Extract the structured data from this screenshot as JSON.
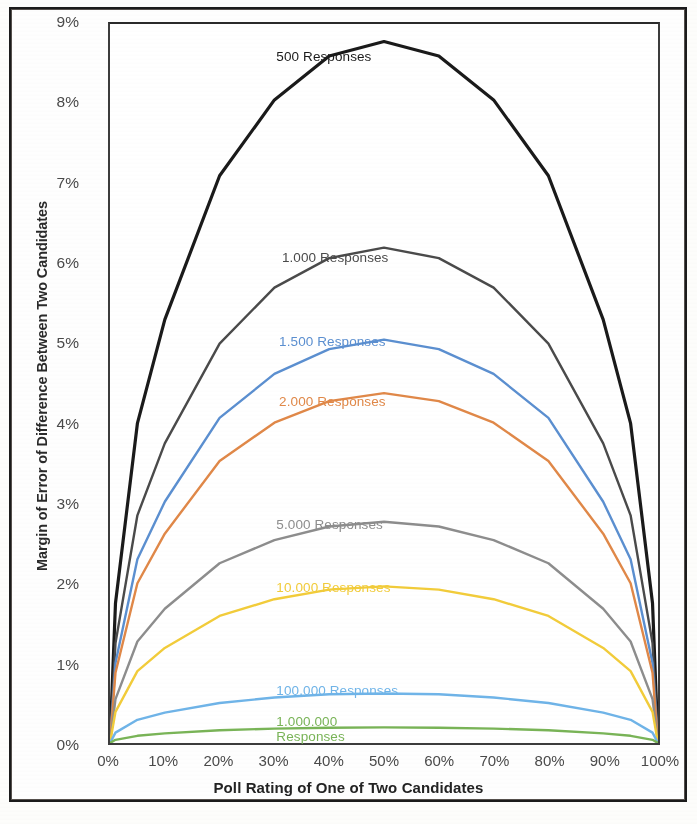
{
  "chart_data": {
    "type": "line",
    "title": "",
    "xlabel": "Poll Rating of One of Two Candidates",
    "ylabel": "Margin of Error of Difference Between Two Candidates",
    "xlim": [
      0,
      100
    ],
    "ylim": [
      0,
      9
    ],
    "grid": false,
    "legend_position": "inline-labels",
    "x_tick_labels": [
      "0%",
      "10%",
      "20%",
      "30%",
      "40%",
      "50%",
      "60%",
      "70%",
      "80%",
      "90%",
      "100%"
    ],
    "x_tick_values": [
      0,
      10,
      20,
      30,
      40,
      50,
      60,
      70,
      80,
      90,
      100
    ],
    "y_tick_labels": [
      "0%",
      "1%",
      "2%",
      "3%",
      "4%",
      "5%",
      "6%",
      "7%",
      "8%",
      "9%"
    ],
    "y_tick_values": [
      0,
      1,
      2,
      3,
      4,
      5,
      6,
      7,
      8,
      9
    ],
    "x": [
      0,
      1,
      5,
      10,
      20,
      30,
      40,
      50,
      60,
      70,
      80,
      90,
      95,
      99,
      100
    ],
    "series": [
      {
        "name": "500 Responses",
        "color": "#1a1a1a",
        "label_x_pct": 30.5,
        "label_y_pct": 96.2,
        "values": [
          0.0,
          1.75,
          4.0,
          5.3,
          7.1,
          8.05,
          8.6,
          8.78,
          8.6,
          8.05,
          7.1,
          5.3,
          4.0,
          1.75,
          0.0
        ]
      },
      {
        "name": "1.000 Responses",
        "color": "#4a4a4a",
        "label_x_pct": 31.5,
        "label_y_pct": 68.5,
        "values": [
          0.0,
          1.25,
          2.85,
          3.75,
          5.0,
          5.7,
          6.07,
          6.2,
          6.07,
          5.7,
          5.0,
          3.75,
          2.85,
          1.25,
          0.0
        ]
      },
      {
        "name": "1.500 Responses",
        "color": "#5b8fd0",
        "label_x_pct": 31.0,
        "label_y_pct": 56.8,
        "values": [
          0.0,
          1.0,
          2.3,
          3.02,
          4.07,
          4.62,
          4.93,
          5.05,
          4.93,
          4.62,
          4.07,
          3.02,
          2.3,
          1.0,
          0.0
        ]
      },
      {
        "name": "2.000 Responses",
        "color": "#e08848",
        "label_x_pct": 31.0,
        "label_y_pct": 48.5,
        "values": [
          0.0,
          0.88,
          2.0,
          2.62,
          3.53,
          4.01,
          4.28,
          4.38,
          4.28,
          4.01,
          3.53,
          2.62,
          2.0,
          0.88,
          0.0
        ]
      },
      {
        "name": "5.000 Responses",
        "color": "#8d8d8d",
        "label_x_pct": 30.5,
        "label_y_pct": 31.5,
        "values": [
          0.0,
          0.55,
          1.27,
          1.68,
          2.25,
          2.54,
          2.71,
          2.77,
          2.71,
          2.54,
          2.25,
          1.68,
          1.27,
          0.55,
          0.0
        ]
      },
      {
        "name": "10.000 Responses",
        "color": "#f2cc3a",
        "label_x_pct": 30.5,
        "label_y_pct": 22.8,
        "values": [
          0.0,
          0.39,
          0.9,
          1.19,
          1.59,
          1.8,
          1.92,
          1.96,
          1.92,
          1.8,
          1.59,
          1.19,
          0.9,
          0.39,
          0.0
        ]
      },
      {
        "name": "100.000 Responses",
        "color": "#6fb4e8",
        "label_x_pct": 30.5,
        "label_y_pct": 8.6,
        "values": [
          0.0,
          0.13,
          0.29,
          0.38,
          0.5,
          0.57,
          0.61,
          0.62,
          0.61,
          0.57,
          0.5,
          0.38,
          0.29,
          0.13,
          0.0
        ]
      },
      {
        "name": "1.000.000 Responses",
        "color": "#79b457",
        "label_x_pct": 30.5,
        "label_y_pct": 4.3,
        "values": [
          0.0,
          0.04,
          0.09,
          0.12,
          0.16,
          0.18,
          0.19,
          0.196,
          0.19,
          0.18,
          0.16,
          0.12,
          0.09,
          0.04,
          0.0
        ]
      }
    ]
  }
}
